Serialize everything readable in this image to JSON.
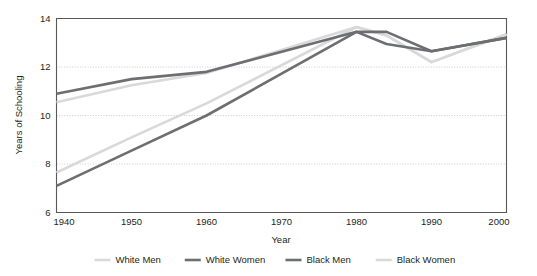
{
  "chart_data": {
    "type": "line",
    "title": "",
    "xlabel": "Year",
    "ylabel": "Years of Schooling",
    "xlim": [
      1940,
      2000
    ],
    "ylim": [
      6,
      14
    ],
    "xticks": [
      1940,
      1950,
      1960,
      1970,
      1980,
      1990,
      2000
    ],
    "yticks": [
      6,
      8,
      10,
      12,
      14
    ],
    "grid": "horizontal-dotted",
    "legend_position": "bottom",
    "x": [
      1940,
      1950,
      1960,
      1980,
      1984,
      1990,
      2000
    ],
    "series": [
      {
        "name": "White Men",
        "color": "#d9d9d9",
        "values": [
          10.55,
          11.25,
          11.75,
          13.65,
          13.3,
          12.2,
          13.35
        ]
      },
      {
        "name": "White Women",
        "color": "#6d6e71",
        "values": [
          10.9,
          11.5,
          11.8,
          13.45,
          13.45,
          12.65,
          13.2
        ]
      },
      {
        "name": "Black Men",
        "color": "#6d6e71",
        "values": [
          7.1,
          8.55,
          10.0,
          13.45,
          12.95,
          12.65,
          13.2
        ]
      },
      {
        "name": "Black Women",
        "color": "#d9d9d9",
        "values": [
          7.65,
          9.1,
          10.5,
          13.65,
          13.3,
          12.2,
          13.35
        ]
      }
    ]
  },
  "legend": {
    "items": [
      {
        "label": "White Men",
        "color": "#d9d9d9"
      },
      {
        "label": "White Women",
        "color": "#6d6e71"
      },
      {
        "label": "Black Men",
        "color": "#6d6e71"
      },
      {
        "label": "Black Women",
        "color": "#d9d9d9"
      }
    ]
  },
  "axes": {
    "y_title": "Years of Schooling",
    "x_title": "Year",
    "y_tick_labels": [
      "6",
      "8",
      "10",
      "12",
      "14"
    ],
    "x_tick_labels": [
      "1940",
      "1950",
      "1960",
      "1970",
      "1980",
      "1990",
      "2000"
    ]
  },
  "colors": {
    "light_series": "#d9d9d9",
    "dark_series": "#6d6e71",
    "axis": "#58585a",
    "grid": "#b9b9bb",
    "text": "#231f20",
    "background": "#ffffff"
  }
}
